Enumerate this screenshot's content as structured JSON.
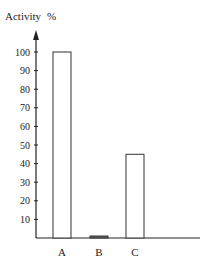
{
  "chart_data": {
    "type": "bar",
    "xlabel": "",
    "ylabel": "Activity %",
    "categories": [
      "A",
      "B",
      "C"
    ],
    "values": [
      100,
      1,
      45
    ],
    "ylim": [
      0,
      100
    ],
    "yticks": [
      10,
      20,
      30,
      40,
      50,
      60,
      70,
      80,
      90,
      100
    ],
    "grid": false,
    "legend": null,
    "bar_style": {
      "fill": "#ffffff",
      "stroke": "#333333"
    }
  },
  "header": {
    "title_word": "Activity",
    "title_unit": "%"
  }
}
